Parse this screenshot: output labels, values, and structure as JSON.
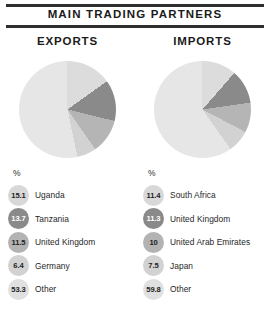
{
  "header": {
    "title": "MAIN TRADING PARTNERS"
  },
  "columns": {
    "exports_label": "EXPORTS",
    "imports_label": "IMPORTS"
  },
  "legend": {
    "percent_symbol": "%"
  },
  "colors": {
    "rule": "#2e2e2e",
    "slice_light": "#e3e3e3",
    "slice_pale": "#dcdcdc",
    "slice_dark": "#8a8a8a",
    "slice_medium": "#b5b5b5",
    "slice_other": "#e8e8e8",
    "text": "#1f1f1f",
    "badge_text_light": "#ffffff"
  },
  "chart_data": [
    {
      "type": "pie",
      "title": "EXPORTS",
      "unit": "%",
      "start_angle": 0,
      "direction": "clockwise",
      "categories": [
        "Uganda",
        "Tanzania",
        "United Kingdom",
        "Germany",
        "Other"
      ],
      "values": [
        15.1,
        13.7,
        11.5,
        6.4,
        53.3
      ],
      "slice_colors": [
        "#dcdcdc",
        "#8a8a8a",
        "#b5b5b5",
        "#d2d2d2",
        "#e6e6e6"
      ],
      "badge_colors": [
        "#d8d8d8",
        "#8a8a8a",
        "#b3b3b3",
        "#d2d2d2",
        "#e0e0e0"
      ],
      "badge_text_dark": [
        false,
        true,
        false,
        false,
        false
      ]
    },
    {
      "type": "pie",
      "title": "IMPORTS",
      "unit": "%",
      "start_angle": 0,
      "direction": "clockwise",
      "categories": [
        "South Africa",
        "United Kingdom",
        "United Arab Emirates",
        "Japan",
        "Other"
      ],
      "values": [
        11.4,
        11.3,
        10,
        7.5,
        59.8
      ],
      "slice_colors": [
        "#dcdcdc",
        "#8a8a8a",
        "#b5b5b5",
        "#d2d2d2",
        "#e6e6e6"
      ],
      "badge_colors": [
        "#d8d8d8",
        "#8a8a8a",
        "#b3b3b3",
        "#d2d2d2",
        "#e0e0e0"
      ],
      "badge_text_dark": [
        false,
        true,
        false,
        false,
        false
      ]
    }
  ]
}
